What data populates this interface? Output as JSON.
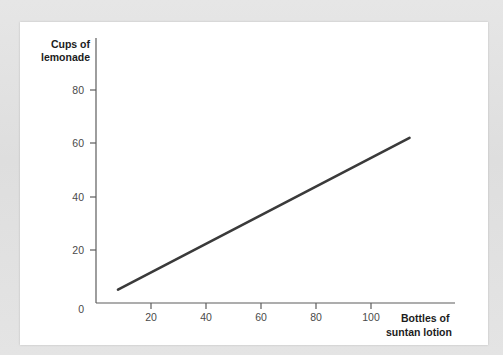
{
  "card": {
    "background_color": "#ffffff",
    "page_background_color": "#e2e2e2"
  },
  "chart_data": {
    "type": "line",
    "title": "",
    "xlabel_line1": "Bottles of",
    "xlabel_line2": "suntan lotion",
    "ylabel_line1": "Cups of",
    "ylabel_line2": "lemonade",
    "xlim": [
      0,
      115
    ],
    "ylim": [
      0,
      90
    ],
    "x_ticks": [
      0,
      20,
      40,
      60,
      80,
      100
    ],
    "x_tick_labels": [
      "0",
      "20",
      "40",
      "60",
      "80",
      "100"
    ],
    "y_ticks": [
      0,
      20,
      40,
      60,
      80
    ],
    "y_tick_labels": [
      "0",
      "20",
      "40",
      "60",
      "80"
    ],
    "grid": false,
    "legend": "none",
    "series": [
      {
        "name": "lemonade vs suntan lotion",
        "color": "#3a3a3a",
        "line_width": 2.6,
        "x": [
          8,
          114
        ],
        "values": [
          5,
          62
        ]
      }
    ],
    "slope_per_unit": 0.538,
    "intercept": 0.7,
    "axis_color": "#5d5d5d",
    "tick_label_color": "#4a4a4a",
    "axis_title_color": "#1c1c1c"
  }
}
